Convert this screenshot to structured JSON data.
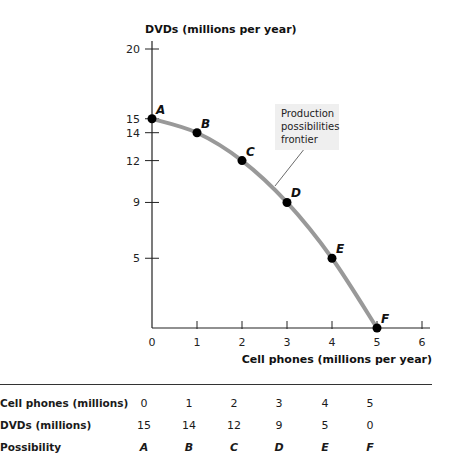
{
  "chart_data": {
    "type": "line",
    "title": "",
    "xlabel": "Cell phones (millions per year)",
    "ylabel": "DVDs (millions per year)",
    "x_ticks": [
      0,
      1,
      2,
      3,
      4,
      5,
      6
    ],
    "y_ticks": [
      5,
      9,
      12,
      14,
      15,
      20
    ],
    "xlim": [
      0,
      6
    ],
    "ylim": [
      0,
      20
    ],
    "grid": false,
    "series": [
      {
        "name": "Production possibilities frontier",
        "x": [
          0,
          1,
          2,
          3,
          4,
          5
        ],
        "y": [
          15,
          14,
          12,
          9,
          5,
          0
        ],
        "point_labels": [
          "A",
          "B",
          "C",
          "D",
          "E",
          "F"
        ],
        "color": "#999999"
      }
    ],
    "annotations": [
      {
        "text": "Production possibilities frontier",
        "points_to": "curve between C and D"
      }
    ]
  },
  "chart": {
    "ylabel": "DVDs (millions per year)",
    "xlabel": "Cell phones (millions per year)",
    "annotation_lines": [
      "Production",
      "possibilities",
      "frontier"
    ],
    "curve_color": "#999999",
    "point_color": "#000000",
    "annotation_bg": "#efefef"
  },
  "table": {
    "rows": [
      {
        "label": "Cell phones (millions)",
        "values": [
          "0",
          "1",
          "2",
          "3",
          "4",
          "5"
        ]
      },
      {
        "label": "DVDs (millions)",
        "values": [
          "15",
          "14",
          "12",
          "9",
          "5",
          "0"
        ]
      },
      {
        "label": "Possibility",
        "values": [
          "A",
          "B",
          "C",
          "D",
          "E",
          "F"
        ]
      }
    ]
  }
}
